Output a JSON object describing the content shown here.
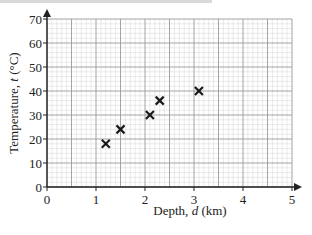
{
  "chart_data": {
    "type": "scatter",
    "title": "",
    "xlabel": "Depth, d (km)",
    "ylabel": "Temperature, t (°C)",
    "xlim": [
      0,
      5
    ],
    "ylim": [
      0,
      70
    ],
    "x_ticks": [
      "0",
      "1",
      "2",
      "3",
      "4",
      "5"
    ],
    "y_ticks": [
      "0",
      "10",
      "20",
      "30",
      "40",
      "50",
      "60",
      "70"
    ],
    "grid": true,
    "grid_minor": true,
    "legend": null,
    "marker": "x",
    "series": [
      {
        "name": "Temperature vs depth",
        "points": [
          {
            "x": 1.2,
            "y": 18
          },
          {
            "x": 1.5,
            "y": 24
          },
          {
            "x": 2.1,
            "y": 30
          },
          {
            "x": 2.3,
            "y": 36
          },
          {
            "x": 3.1,
            "y": 40
          }
        ]
      }
    ]
  },
  "labels": {
    "xlabel_prefix": "Depth, ",
    "xlabel_var": "d",
    "xlabel_suffix": " (km)",
    "ylabel_prefix": "Temperature, ",
    "ylabel_var": "t",
    "ylabel_suffix": " (°C)"
  },
  "colors": {
    "axis": "#222222",
    "grid_major": "#9a9a9a",
    "grid_minor": "#d4d4d4",
    "marker": "#1a1a1a"
  }
}
